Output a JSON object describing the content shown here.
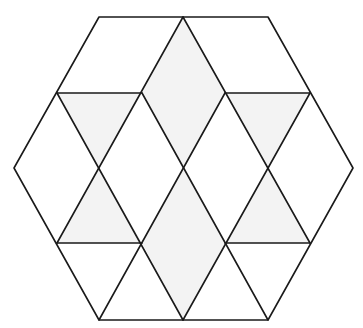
{
  "diagram": {
    "shape": "regular-hexagon-tiled",
    "width": 363,
    "height": 328,
    "colors": {
      "background": "#ffffff",
      "stroke": "#1a1a1a",
      "shade": "#f3f3f3"
    },
    "hexagon": [
      [
        99,
        17
      ],
      [
        268,
        17
      ],
      [
        353,
        168
      ],
      [
        268,
        320
      ],
      [
        99,
        320
      ],
      [
        14,
        168
      ]
    ],
    "shaded_regions": [
      {
        "name": "upper-center-rhombus",
        "points": [
          [
            183,
            17
          ],
          [
            225,
            93
          ],
          [
            183,
            168
          ],
          [
            142,
            93
          ]
        ]
      },
      {
        "name": "lower-center-rhombus",
        "points": [
          [
            183,
            168
          ],
          [
            225,
            243
          ],
          [
            183,
            320
          ],
          [
            142,
            243
          ]
        ]
      },
      {
        "name": "upper-left-triangle",
        "points": [
          [
            57,
            93
          ],
          [
            142,
            93
          ],
          [
            99,
            168
          ]
        ]
      },
      {
        "name": "lower-left-triangle",
        "points": [
          [
            99,
            168
          ],
          [
            142,
            243
          ],
          [
            57,
            243
          ]
        ]
      },
      {
        "name": "upper-right-triangle",
        "points": [
          [
            225,
            93
          ],
          [
            310,
            93
          ],
          [
            268,
            168
          ]
        ]
      },
      {
        "name": "lower-right-triangle",
        "points": [
          [
            268,
            168
          ],
          [
            310,
            243
          ],
          [
            225,
            243
          ]
        ]
      }
    ],
    "lines": [
      {
        "name": "upper-left-horizontal",
        "from": [
          57,
          93
        ],
        "to": [
          142,
          93
        ]
      },
      {
        "name": "upper-right-horizontal",
        "from": [
          225,
          93
        ],
        "to": [
          310,
          93
        ]
      },
      {
        "name": "lower-left-horizontal",
        "from": [
          57,
          243
        ],
        "to": [
          142,
          243
        ]
      },
      {
        "name": "lower-right-horizontal",
        "from": [
          225,
          243
        ],
        "to": [
          310,
          243
        ]
      },
      {
        "name": "diag-top-center-left",
        "from": [
          183,
          17
        ],
        "to": [
          57,
          243
        ]
      },
      {
        "name": "diag-top-center-right",
        "from": [
          183,
          17
        ],
        "to": [
          310,
          243
        ]
      },
      {
        "name": "diag-bottom-center-left",
        "from": [
          183,
          320
        ],
        "to": [
          57,
          93
        ]
      },
      {
        "name": "diag-bottom-center-right",
        "from": [
          183,
          320
        ],
        "to": [
          310,
          93
        ]
      },
      {
        "name": "diag-inner-a",
        "from": [
          142,
          93
        ],
        "to": [
          268,
          320
        ]
      },
      {
        "name": "diag-inner-b",
        "from": [
          225,
          93
        ],
        "to": [
          99,
          320
        ]
      }
    ]
  }
}
